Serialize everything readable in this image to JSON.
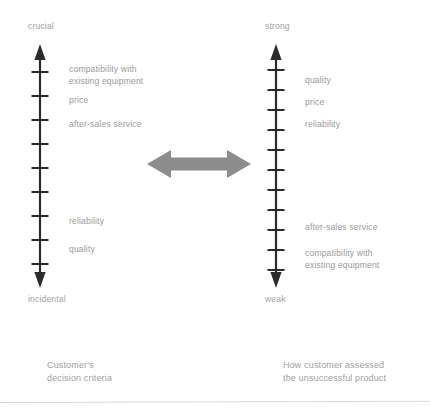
{
  "diagram": {
    "title_hidden": "",
    "background_color": "#ffffff",
    "axis_color": "#2b2b2b",
    "text_color": "#9a9a9a",
    "arrow_color": "#8c8c8c"
  },
  "left_scale": {
    "top_label": "crucial",
    "bottom_label": "incidental",
    "tick_count": 9,
    "caption": "Customer's\ndecision criteria",
    "items": [
      {
        "label": "compatibility with\nexisting equipment",
        "position": 1
      },
      {
        "label": "price",
        "position": 2
      },
      {
        "label": "after-sales service",
        "position": 3
      },
      {
        "label": "reliability",
        "position": 7
      },
      {
        "label": "quality",
        "position": 8
      }
    ]
  },
  "right_scale": {
    "top_label": "strong",
    "bottom_label": "weak",
    "tick_count": 11,
    "caption": "How customer assessed\nthe unsuccessful product",
    "items": [
      {
        "label": "quality",
        "position": 1
      },
      {
        "label": "price",
        "position": 2
      },
      {
        "label": "reliability",
        "position": 3
      },
      {
        "label": "after-sales service",
        "position": 9
      },
      {
        "label": "compatibility with\nexisting equipment",
        "position": 10
      }
    ]
  },
  "connector": {
    "name": "double-headed-arrow",
    "direction": "bidirectional",
    "color": "#8c8c8c"
  }
}
